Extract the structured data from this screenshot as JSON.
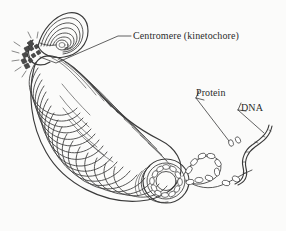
{
  "figure": {
    "background_color": "#fbfbfa",
    "ink_color": "#3a3a3a",
    "text_color": "#2b2b2b",
    "width": 286,
    "height": 231
  },
  "labels": {
    "centromere": "Centromere (kinetochore)",
    "protein": "Protein",
    "dna": "DNA"
  },
  "parts": {
    "short_arm": "short-arm-coil",
    "long_arm": "long-arm-solenoid-coil",
    "centromere_constriction": "centromere-constriction",
    "cut_end": "chromosome-cut-end-cross-section",
    "nucleosome_ring": "nucleosome-ring",
    "chromatin_fiber": "beads-on-a-string-chromatin-fiber",
    "histone_pair": "free-histone-protein-pair",
    "dna_strand": "double-helix-dna-strand"
  },
  "annotations": {
    "centromere_leader": "leader-line-to-centromere",
    "protein_arrow": "arrow-to-histone-protein",
    "dna_arrow": "arrow-to-dna-strand"
  },
  "counts": {
    "nucleosomes_in_ring": 12,
    "nucleosomes_on_fiber": 11,
    "short_arm_loops": 6,
    "long_arm_loops": 26
  }
}
